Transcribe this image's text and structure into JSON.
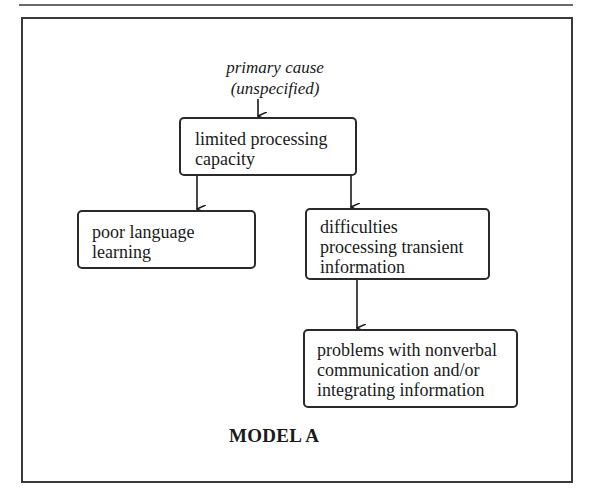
{
  "diagram": {
    "title": "MODEL A",
    "nodes": {
      "primary_cause": "primary cause\n(unspecified)",
      "limited_capacity": "limited processing\ncapacity",
      "poor_language": "poor language\nlearning",
      "transient": "difficulties\nprocessing transient\ninformation",
      "nonverbal": "problems with nonverbal\ncommunication and/or\nintegrating information"
    },
    "edges": [
      {
        "from": "primary_cause",
        "to": "limited_capacity"
      },
      {
        "from": "limited_capacity",
        "to": "poor_language"
      },
      {
        "from": "limited_capacity",
        "to": "transient"
      },
      {
        "from": "transient",
        "to": "nonverbal"
      }
    ]
  }
}
